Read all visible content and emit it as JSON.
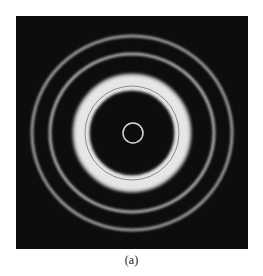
{
  "figure": {
    "background_color": "#0d0d0d",
    "center": [
      116,
      117
    ],
    "rings": [
      {
        "name": "outer-ring",
        "rx": 100,
        "ry": 97,
        "width": 3,
        "color": "#9a9a9a"
      },
      {
        "name": "second-ring",
        "rx": 82,
        "ry": 79,
        "width": 3,
        "color": "#a8a8a8"
      },
      {
        "name": "bright-band",
        "rx": 50,
        "ry": 50,
        "width": 14,
        "color": "#e6e6e6"
      },
      {
        "name": "bright-band-inner-line",
        "rx": 48,
        "ry": 48,
        "width": 1,
        "color": "#8a8a8a"
      },
      {
        "name": "center-ring",
        "rx": 10,
        "ry": 10,
        "width": 1.5,
        "color": "#d8d8d8"
      }
    ]
  },
  "caption": "(a)"
}
